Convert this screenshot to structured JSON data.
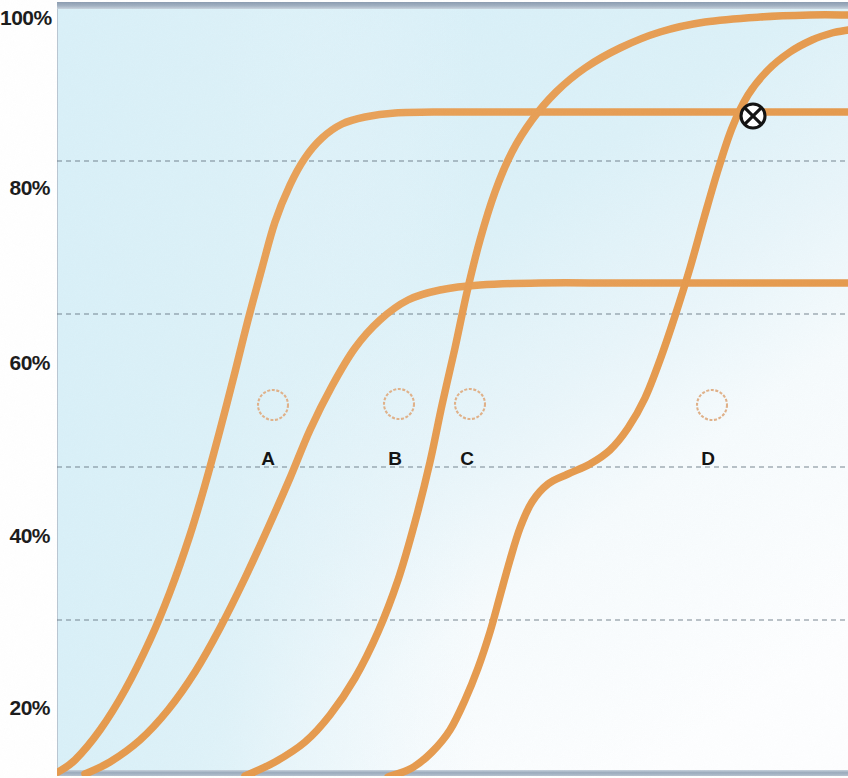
{
  "figure": {
    "kind": "scanned-line-chart",
    "background_color": "#ffffff",
    "plot_fill_color": "#dcf1f8",
    "plot_fill_color_low": "#fbfdfe",
    "curve_color": "#e79f56",
    "curve_color_dark": "#d98f45",
    "gridline_color": "#6b7a88",
    "edge_band_color": "#93a2b4",
    "marker_color": "#111111",
    "label_color": "#1b1b1b",
    "annotation_circle_color": "#e3b68d"
  },
  "axes": {
    "y_title": "",
    "x_title": "",
    "y_ticks": [
      {
        "label": "100%",
        "value": 100,
        "y_px": 18
      },
      {
        "label": "80%",
        "value": 80,
        "y_px": 188
      },
      {
        "label": "60%",
        "value": 60,
        "y_px": 363
      },
      {
        "label": "40%",
        "value": 40,
        "y_px": 536
      },
      {
        "label": "20%",
        "value": 20,
        "y_px": 708
      }
    ],
    "gridlines_y_px": [
      161,
      314,
      467,
      620
    ],
    "grid_style": "dashed",
    "x_ticks": []
  },
  "annotations": {
    "point_labels": [
      {
        "id": "A",
        "label": "A",
        "x_px": 268,
        "y_px": 461,
        "circle_x": 273,
        "circle_y": 405,
        "circle_r": 15
      },
      {
        "id": "B",
        "label": "B",
        "x_px": 395,
        "y_px": 461,
        "circle_x": 399,
        "circle_y": 404,
        "circle_r": 15
      },
      {
        "id": "C",
        "label": "C",
        "x_px": 467,
        "y_px": 461,
        "circle_x": 470,
        "circle_y": 404,
        "circle_r": 15
      },
      {
        "id": "D",
        "label": "D",
        "x_px": 708,
        "y_px": 461,
        "circle_x": 712,
        "circle_y": 405,
        "circle_r": 15
      }
    ],
    "x_marker": {
      "name": "circled-x-marker",
      "x_px": 753,
      "y_px": 116,
      "radius_px": 12
    }
  },
  "chart_data": {
    "type": "line",
    "title": "",
    "subtitle": "",
    "xlabel": "",
    "ylabel": "",
    "ylim": [
      10,
      102
    ],
    "xlim": [
      0,
      100
    ],
    "grid": true,
    "legend": "none",
    "y_tick_labels": [
      "20%",
      "40%",
      "60%",
      "80%",
      "100%"
    ],
    "y_tick_values": [
      20,
      40,
      60,
      80,
      100
    ],
    "annotations_on_plot": [
      "A",
      "B",
      "C",
      "D",
      "circled-x"
    ],
    "series": [
      {
        "name": "A",
        "note": "steepest / leftmost sigmoid, plateaus near 88%",
        "plateau_percent": 88,
        "points_px": "58,772 75,760 100,730 125,690 150,640 170,592 190,535 205,485 220,430 235,372 248,320 262,268 275,222 290,185 305,158 322,138 342,124 365,117 395,113 440,112 520,112 640,112 760,112 848,112"
      },
      {
        "name": "B",
        "note": "second sigmoid, plateaus near 68%",
        "plateau_percent": 68,
        "points_px": "85,774 110,762 140,740 168,710 195,672 220,628 245,578 268,528 290,478 310,430 332,386 355,348 380,320 408,300 440,290 480,285 540,283 620,283 720,283 848,283"
      },
      {
        "name": "C",
        "note": "third sigmoid, rises to 100% top of plot",
        "plateau_percent": 100,
        "points_px": "245,776 275,762 305,742 330,715 355,678 378,632 398,580 415,522 430,462 442,405 455,348 467,292 480,240 495,192 512,152 532,120 556,92 585,68 620,48 660,32 705,22 760,17 810,15 848,15"
      },
      {
        "name": "D",
        "note": "rightmost curve with S inflection near 48%, plateaus toward 100% off right edge",
        "plateau_percent": 100,
        "points_px": "388,777 412,768 432,752 450,730 465,700 478,668 490,632 500,596 510,560 520,528 532,502 548,484 568,474 590,464 610,450 628,428 645,398 660,360 675,316 690,268 704,218 718,170 732,128 748,95 768,70 790,52 812,40 832,33 848,30"
      }
    ]
  }
}
